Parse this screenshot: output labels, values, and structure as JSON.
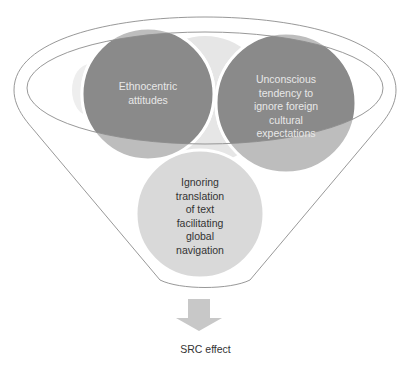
{
  "diagram": {
    "type": "funnel",
    "colors": {
      "circle_dark": "#8a8a8a",
      "circle_mid": "#bcbcbc",
      "circle_light": "#d9d9d9",
      "background_circle": "#e4e4e4",
      "outline": "#8c8c8c",
      "arrow": "#c8c8c8"
    },
    "nodes": [
      {
        "id": "ethnocentric",
        "label_lines": [
          "Ethnocentric",
          "attitudes"
        ]
      },
      {
        "id": "unconscious",
        "label_lines": [
          "Unconscious",
          "tendency to",
          "ignore foreign",
          "cultural",
          "expectations"
        ]
      },
      {
        "id": "ignoring",
        "label_lines": [
          "Ignoring",
          "translation",
          "of text",
          "facilitating",
          "global",
          "navigation"
        ]
      }
    ],
    "output": {
      "label": "SRC effect",
      "arrow_icon": "down-arrow-icon"
    }
  }
}
